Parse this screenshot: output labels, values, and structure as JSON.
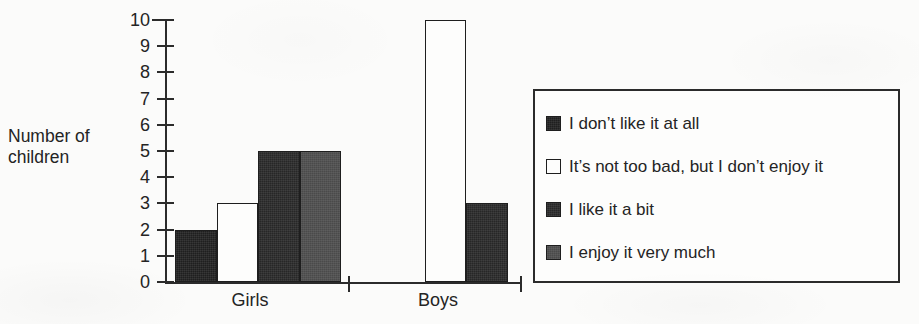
{
  "chart_data": {
    "type": "bar",
    "title": "",
    "subtitle": "",
    "xlabel": "",
    "ylabel": "Number of children",
    "ylabel_lines": [
      "Number of",
      "children"
    ],
    "categories": [
      "Girls",
      "Boys"
    ],
    "ylim": [
      0,
      10
    ],
    "ytick_labels": [
      "0",
      "1",
      "2",
      "3",
      "4",
      "5",
      "6",
      "7",
      "8",
      "9",
      "10"
    ],
    "ytick_values": [
      0,
      1,
      2,
      3,
      4,
      5,
      6,
      7,
      8,
      9,
      10
    ],
    "grid": false,
    "legend_position": "right",
    "series": [
      {
        "name": "I don’t like it at all",
        "values": [
          2,
          0
        ],
        "swatch": "black"
      },
      {
        "name": "It’s not too bad, but I don’t enjoy it",
        "values": [
          3,
          10
        ],
        "swatch": "white"
      },
      {
        "name": "I like it a bit",
        "values": [
          5,
          3
        ],
        "swatch": "dark"
      },
      {
        "name": "I enjoy it very much",
        "values": [
          5,
          0
        ],
        "swatch": "gray"
      }
    ],
    "annotations": []
  },
  "colors": {
    "axis": "#2b2b2b",
    "text": "#242424",
    "swatch_black": "#1f1f1f",
    "swatch_white": "#fdfdfc",
    "swatch_dark": "#272727",
    "swatch_gray": "#4a4a4a",
    "background": "#fbfbfa"
  },
  "legend": {
    "entries": [
      {
        "label": "I don’t like it at all",
        "swatch": "black"
      },
      {
        "label": "It’s not too bad, but I don’t enjoy it",
        "swatch": "white"
      },
      {
        "label": "I like it a bit",
        "swatch": "dark"
      },
      {
        "label": "I enjoy it very much",
        "swatch": "gray"
      }
    ]
  }
}
